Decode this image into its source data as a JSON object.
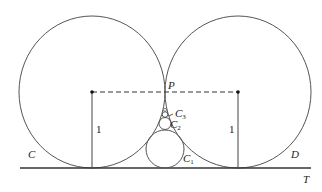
{
  "diagram": {
    "labels": {
      "P": "P",
      "C": "C",
      "D": "D",
      "T": "T",
      "C1": "C",
      "C1_sub": "1",
      "C2": "C",
      "C2_sub": "2",
      "C3": "C",
      "C3_sub": "3",
      "left_radius": "1",
      "right_radius": "1"
    },
    "colors": {
      "stroke": "#555555",
      "text": "#222222"
    }
  }
}
